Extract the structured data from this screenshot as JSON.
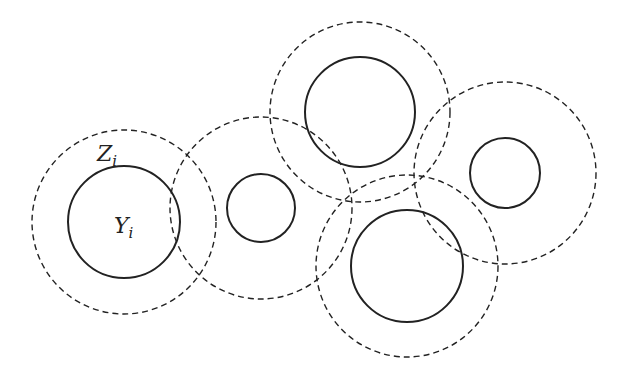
{
  "diagram": {
    "stroke_color": "#222222",
    "background": "#ffffff",
    "labels": {
      "outer": "Z",
      "outer_sub": "i",
      "inner": "Y",
      "inner_sub": "i"
    },
    "circles": [
      {
        "id": "c1",
        "cx": 124,
        "cy": 222,
        "outer_r": 92,
        "inner_r": 56
      },
      {
        "id": "c2",
        "cx": 261,
        "cy": 208,
        "outer_r": 91,
        "inner_r": 34
      },
      {
        "id": "c3",
        "cx": 360,
        "cy": 112,
        "outer_r": 90,
        "inner_r": 55
      },
      {
        "id": "c4",
        "cx": 407,
        "cy": 266,
        "outer_r": 91,
        "inner_r": 56
      },
      {
        "id": "c5",
        "cx": 505,
        "cy": 173,
        "outer_r": 91,
        "inner_r": 35
      }
    ]
  }
}
